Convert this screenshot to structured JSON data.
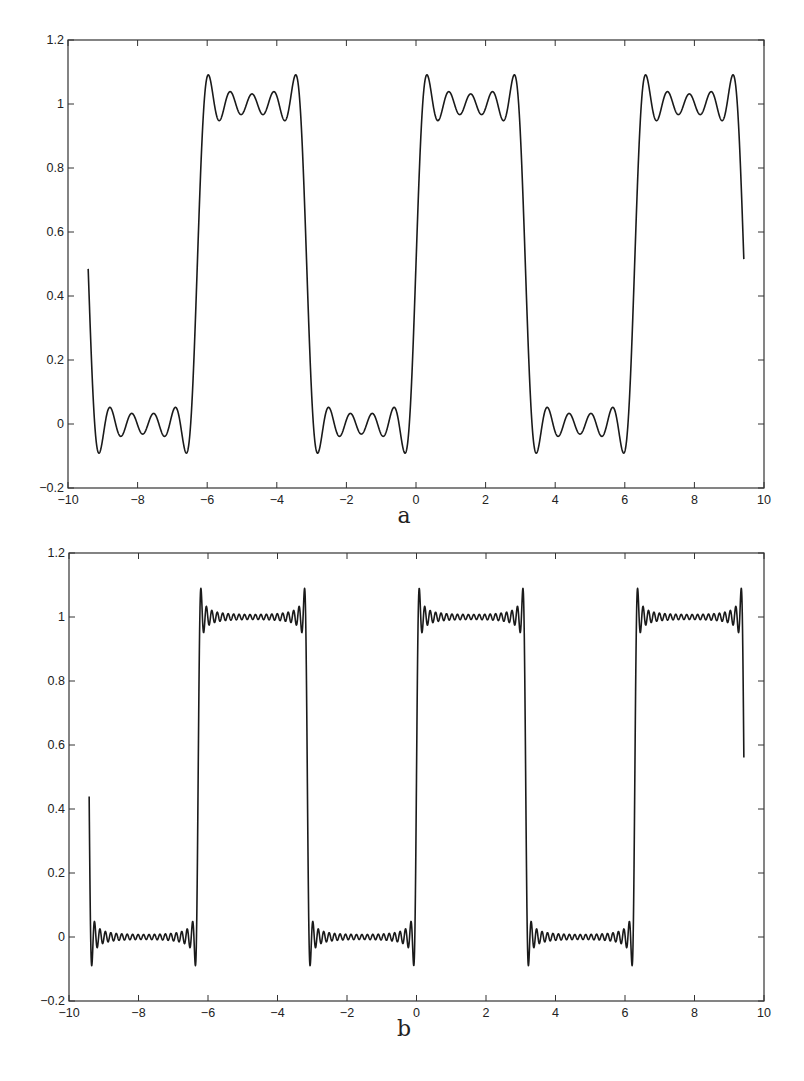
{
  "chart_data": [
    {
      "type": "line",
      "title": "",
      "caption": "a",
      "xlabel": "",
      "ylabel": "",
      "xlim": [
        -10,
        10
      ],
      "ylim": [
        -0.2,
        1.2
      ],
      "xticks": [
        -10,
        -8,
        -6,
        -4,
        -2,
        0,
        2,
        4,
        6,
        8,
        10
      ],
      "xtick_labels": [
        "-10",
        "-8",
        "-6",
        "-4",
        "-2",
        "0",
        "2",
        "4",
        "6",
        "8",
        "10"
      ],
      "yticks": [
        -0.2,
        0,
        0.2,
        0.4,
        0.6,
        0.8,
        1,
        1.2
      ],
      "ytick_labels": [
        "-0.2",
        "0",
        "0.2",
        "0.4",
        "0.6",
        "0.8",
        "1",
        "1.2"
      ],
      "grid": false,
      "legend": null,
      "series": [
        {
          "name": "Fourier partial sum of square wave",
          "function": "0.5 + (2/pi) * sum_{k odd <= N} sin(k x)/k",
          "harmonics_N": 10,
          "x_range": [
            -9.42,
            9.42
          ],
          "overshoot_max": 1.09,
          "undershoot_min": -0.09,
          "start_value": 0.5,
          "end_value": 0.53
        }
      ]
    },
    {
      "type": "line",
      "title": "",
      "caption": "b",
      "xlabel": "",
      "ylabel": "",
      "xlim": [
        -10,
        10
      ],
      "ylim": [
        -0.2,
        1.2
      ],
      "xticks": [
        -10,
        -8,
        -6,
        -4,
        -2,
        0,
        2,
        4,
        6,
        8,
        10
      ],
      "xtick_labels": [
        "-10",
        "-8",
        "-6",
        "-4",
        "-2",
        "0",
        "2",
        "4",
        "6",
        "8",
        "10"
      ],
      "yticks": [
        -0.2,
        0,
        0.2,
        0.4,
        0.6,
        0.8,
        1,
        1.2
      ],
      "ytick_labels": [
        "-0.2",
        "0",
        "0.2",
        "0.4",
        "0.6",
        "0.8",
        "1",
        "1.2"
      ],
      "grid": false,
      "legend": null,
      "series": [
        {
          "name": "Fourier partial sum of square wave",
          "function": "0.5 + (2/pi) * sum_{k odd <= N} sin(k x)/k",
          "harmonics_N": 40,
          "x_range": [
            -9.42,
            9.42
          ],
          "overshoot_max": 1.09,
          "undershoot_min": -0.09,
          "start_value": 0.5,
          "end_value": 0.62
        }
      ]
    }
  ],
  "layout": {
    "panels": [
      {
        "plot_left": 68,
        "plot_right": 764,
        "plot_top": 40,
        "plot_bottom": 488,
        "caption_y": 519,
        "caption_x": 404
      },
      {
        "plot_left": 69,
        "plot_right": 764,
        "plot_top": 553,
        "plot_bottom": 1001,
        "caption_y": 1032,
        "caption_x": 404
      }
    ]
  }
}
